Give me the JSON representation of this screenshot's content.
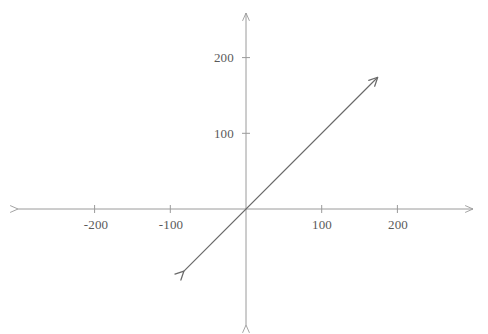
{
  "chart_data": {
    "type": "line",
    "title": "",
    "subtitle": "",
    "xlabel": "",
    "ylabel": "",
    "grid": false,
    "legend": null,
    "axis_style": "cartesian-arrows",
    "xlim": [
      -301,
      300
    ],
    "ylim": [
      -258,
      258
    ],
    "xticks": [
      -200,
      -100,
      100,
      200
    ],
    "yticks": [
      100,
      200
    ],
    "xtick_labels": [
      "-200",
      "-100",
      "100",
      "200"
    ],
    "ytick_labels": [
      "100",
      "200"
    ],
    "series": [
      {
        "name": "y = x",
        "equation": "y = x",
        "slope": 1,
        "intercept": 0,
        "arrow_start": true,
        "arrow_end": true,
        "x": [
          -82,
          174
        ],
        "values": [
          -82,
          174
        ],
        "points": [
          {
            "x": -82,
            "y": -82
          },
          {
            "x": 0,
            "y": 0
          },
          {
            "x": 174,
            "y": 174
          }
        ]
      }
    ],
    "annotations": [],
    "colors": {
      "line": "#6a6a6a",
      "axis": "#9a9a9a",
      "tick": "#9a9a9a",
      "label": "#5a5a5a",
      "background": "#ffffff"
    }
  },
  "geometry": {
    "origin_x": 246,
    "origin_y": 209,
    "px_per_unit": 0.757,
    "x_axis_left_tip": 18,
    "x_axis_right_tip": 473,
    "y_axis_top_tip": 13,
    "y_axis_bottom_tip": 325,
    "tick_half_len": 4
  },
  "labels": {
    "x": [
      {
        "text": "-200",
        "px": 96,
        "py": 218
      },
      {
        "text": "-100",
        "px": 171,
        "py": 218
      },
      {
        "text": "100",
        "px": 322,
        "py": 218
      },
      {
        "text": "200",
        "px": 398,
        "py": 218
      }
    ],
    "y": [
      {
        "text": "200",
        "px": 234,
        "py": 57
      },
      {
        "text": "100",
        "px": 234,
        "py": 133
      }
    ]
  }
}
